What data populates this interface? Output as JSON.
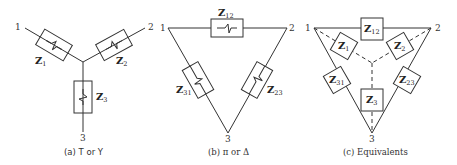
{
  "diagram": {
    "panels": [
      {
        "id": "a",
        "caption": "(a) T or Y",
        "nodes": [
          "1",
          "2",
          "3"
        ],
        "impedances": [
          {
            "main": "Z",
            "sub": "1"
          },
          {
            "main": "Z",
            "sub": "2"
          },
          {
            "main": "Z",
            "sub": "3"
          }
        ]
      },
      {
        "id": "b",
        "caption": "(b) π or Δ",
        "nodes": [
          "1",
          "2",
          "3"
        ],
        "impedances": [
          {
            "main": "Z",
            "sub": "12"
          },
          {
            "main": "Z",
            "sub": "31"
          },
          {
            "main": "Z",
            "sub": "23"
          }
        ]
      },
      {
        "id": "c",
        "caption": "(c) Equivalents",
        "nodes": [
          "1",
          "2",
          "3"
        ],
        "impedances": [
          {
            "main": "Z",
            "sub": "12"
          },
          {
            "main": "Z",
            "sub": "1"
          },
          {
            "main": "Z",
            "sub": "2"
          },
          {
            "main": "Z",
            "sub": "31"
          },
          {
            "main": "Z",
            "sub": "23"
          },
          {
            "main": "Z",
            "sub": "3"
          }
        ]
      }
    ]
  }
}
